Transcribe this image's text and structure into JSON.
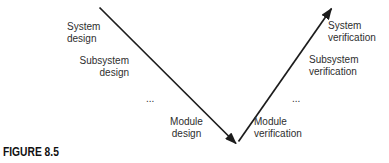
{
  "figure_caption": "FIGURE 8.5",
  "colors": {
    "line": "#1c1c1c",
    "text": "#2e2e2e",
    "caption": "#101010",
    "background": "#ffffff"
  },
  "v_model": {
    "design_branch": {
      "system": "System\ndesign",
      "subsystem": "Subsystem\ndesign",
      "ellipsis": "...",
      "module": "Module\ndesign"
    },
    "verification_branch": {
      "module": "Module\nverification",
      "ellipsis": "...",
      "subsystem": "Subsystem\nverification",
      "system": "System\nverification"
    }
  }
}
